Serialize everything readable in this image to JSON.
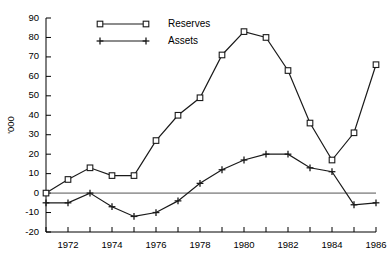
{
  "chart_data": {
    "type": "line",
    "title": "",
    "xlabel": "",
    "ylabel": "'000",
    "x": [
      1971,
      1972,
      1973,
      1974,
      1975,
      1976,
      1977,
      1978,
      1979,
      1980,
      1981,
      1982,
      1983,
      1984,
      1985,
      1986
    ],
    "xlim": [
      1971,
      1986
    ],
    "ylim": [
      -20,
      90
    ],
    "ytick_labels": [
      "90",
      "80",
      "70",
      "60",
      "50",
      "40",
      "30",
      "20",
      "10",
      "0",
      "-10",
      "-20"
    ],
    "yticks": [
      90,
      80,
      70,
      60,
      50,
      40,
      30,
      20,
      10,
      0,
      -10,
      -20
    ],
    "xtick_labels": [
      "1972",
      "1974",
      "1976",
      "1978",
      "1980",
      "1982",
      "1984",
      "1986"
    ],
    "xticks": [
      1972,
      1974,
      1976,
      1978,
      1980,
      1982,
      1984,
      1986
    ],
    "xtick_minor": [
      1971,
      1973,
      1975,
      1977,
      1979,
      1981,
      1983,
      1985
    ],
    "grid": false,
    "zero_line": true,
    "legend_position": "top-left",
    "series": [
      {
        "name": "Reserves",
        "marker": "square",
        "values": [
          0,
          7,
          13,
          9,
          9,
          27,
          40,
          49,
          71,
          83,
          80,
          63,
          36,
          17,
          31,
          66
        ]
      },
      {
        "name": "Assets",
        "marker": "plus",
        "values": [
          -5,
          -5,
          0,
          -7,
          -12,
          -10,
          -4,
          5,
          12,
          17,
          20,
          20,
          13,
          11,
          -6,
          -5
        ]
      }
    ]
  },
  "legend": {
    "items": [
      {
        "label": "Reserves",
        "marker": "square"
      },
      {
        "label": "Assets",
        "marker": "plus"
      }
    ]
  }
}
